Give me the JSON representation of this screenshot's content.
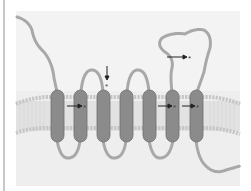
{
  "figure": {
    "colors": {
      "panel_bg": "#ebebeb",
      "panel_top_bg": "#f1f1f1",
      "helix_fill": "#8a8a8a",
      "helix_stroke": "#6e6e6e",
      "chain": "#a9a9a9",
      "lipid_head": "#c9c9c9",
      "lipid_tail": "#dcdcdc",
      "arrow": "#222222",
      "left_bar": "#c8c8c8"
    },
    "helices": [
      {
        "id": "TM1",
        "cx": 57
      },
      {
        "id": "TM2",
        "cx": 80
      },
      {
        "id": "TM3",
        "cx": 103
      },
      {
        "id": "TM4",
        "cx": 126
      },
      {
        "id": "TM5",
        "cx": 149
      },
      {
        "id": "TM6",
        "cx": 173
      },
      {
        "id": "TM7",
        "cx": 196
      }
    ],
    "markers": [
      {
        "label": "*",
        "direction": "right",
        "x": 84,
        "y": 107
      },
      {
        "label": "*",
        "direction": "down",
        "x": 108,
        "y": 82
      },
      {
        "label": "*",
        "direction": "right",
        "x": 174,
        "y": 107
      },
      {
        "label": "*",
        "direction": "right",
        "x": 198,
        "y": 107
      },
      {
        "label": "*",
        "direction": "right",
        "x": 190,
        "y": 57
      }
    ]
  }
}
